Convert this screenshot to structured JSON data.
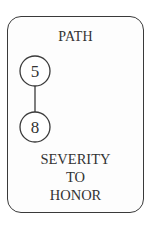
{
  "card": {
    "title": "PATH",
    "nodes": [
      {
        "label": "5"
      },
      {
        "label": "8"
      }
    ],
    "caption_lines": [
      "SEVERITY",
      "TO",
      "HONOR"
    ]
  },
  "colors": {
    "ink": "#333333",
    "border": "#3a3a3a",
    "background": "#ffffff"
  }
}
